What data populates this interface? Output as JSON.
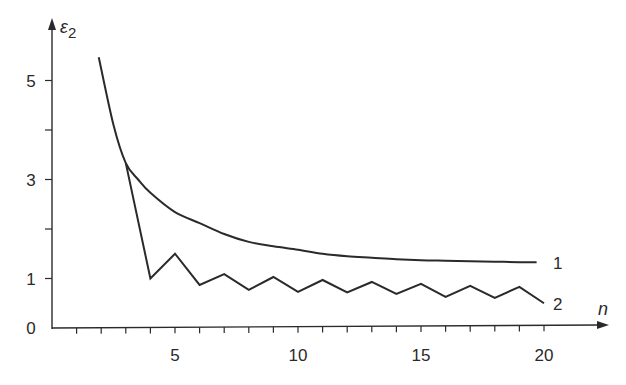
{
  "chart_data": {
    "type": "line",
    "title": "",
    "xlabel": "n",
    "ylabel": "ε2",
    "xlim": [
      0,
      22.5
    ],
    "ylim": [
      0,
      6.2
    ],
    "grid": false,
    "legend": "inline labels at right end of each curve",
    "x_ticks": {
      "minor_every": 1,
      "labels": [
        {
          "value": 5,
          "text": "5"
        },
        {
          "value": 10,
          "text": "10"
        },
        {
          "value": 15,
          "text": "15"
        },
        {
          "value": 20,
          "text": "20"
        }
      ]
    },
    "y_ticks": {
      "minor": [
        1,
        2,
        3,
        4,
        5
      ],
      "labels": [
        {
          "value": 0,
          "text": "0"
        },
        {
          "value": 1,
          "text": "1"
        },
        {
          "value": 3,
          "text": "3"
        },
        {
          "value": 5,
          "text": "5"
        }
      ]
    },
    "series": [
      {
        "name": "1",
        "style": "smooth",
        "x": [
          1.9,
          2.5,
          3,
          3.5,
          4,
          5,
          6,
          7,
          8,
          9,
          10,
          11,
          12,
          13,
          14,
          15,
          16,
          17,
          18,
          19,
          19.7
        ],
        "values": [
          5.47,
          4.1,
          3.33,
          3.0,
          2.73,
          2.34,
          2.12,
          1.9,
          1.74,
          1.65,
          1.58,
          1.5,
          1.45,
          1.42,
          1.39,
          1.37,
          1.36,
          1.35,
          1.34,
          1.33,
          1.33
        ]
      },
      {
        "name": "2",
        "style": "polyline",
        "x": [
          3,
          4,
          5,
          6,
          7,
          8,
          9,
          10,
          11,
          12,
          13,
          14,
          15,
          16,
          17,
          18,
          19,
          20
        ],
        "values": [
          3.33,
          1.0,
          1.5,
          0.87,
          1.09,
          0.77,
          1.03,
          0.73,
          0.97,
          0.72,
          0.93,
          0.69,
          0.89,
          0.63,
          0.85,
          0.61,
          0.83,
          0.5
        ]
      }
    ],
    "series_labels": [
      {
        "text": "1",
        "anchor_series": "1"
      },
      {
        "text": "2",
        "anchor_series": "2"
      }
    ]
  }
}
